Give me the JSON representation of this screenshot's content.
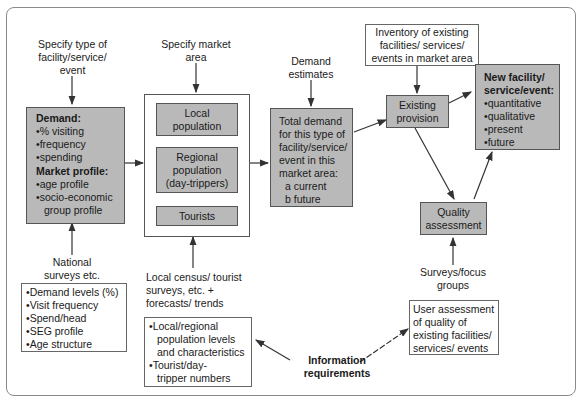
{
  "diagram": {
    "top_labels": {
      "specify_type": "Specify type of\nfacility/service/\nevent",
      "specify_market": "Specify market\narea",
      "demand_estimates": "Demand\nestimates",
      "inventory": "Inventory of existing\nfacilities/ services/\nevents in market area"
    },
    "demand_box": {
      "demand_heading": "Demand:",
      "demand_items": [
        "% visiting",
        "frequency",
        "spending"
      ],
      "profile_heading": "Market profile:",
      "profile_items": [
        "age profile",
        "socio-economic",
        "group profile"
      ]
    },
    "market_area": {
      "local": "Local\npopulation",
      "regional": "Regional\npopulation\n(day-trippers)",
      "tourists": "Tourists"
    },
    "total_demand": {
      "lines": [
        "Total demand",
        "for this type of",
        "facility/service/",
        "event in this",
        "market area:"
      ],
      "a": "a current",
      "b": "b future"
    },
    "existing_provision": "Existing\nprovision",
    "new_facility": {
      "heading": "New facility/\nservice/event:",
      "items": [
        "quantitative",
        "qualitative",
        "present",
        "future"
      ]
    },
    "quality_assessment": "Quality\nassessment",
    "bottom_labels": {
      "national_surveys": "National\nsurveys etc.",
      "local_census": "Local census/ tourist\nsurveys, etc. +\nforecasts/ trends",
      "surveys_focus": "Surveys/focus\ngroups",
      "information_requirements": "Information\nrequirements"
    },
    "national_box": [
      "Demand levels (%)",
      "Visit frequency",
      "Spend/head",
      "SEG profile",
      "Age structure"
    ],
    "local_box": {
      "item1": "Local/regional",
      "item1b": "population levels",
      "item1c": "and characteristics",
      "item2": "Tourist/day-",
      "item2b": "tripper numbers"
    },
    "user_box": "User assessment\nof quality of\nexisting facilities/\nservices/ events"
  },
  "colors": {
    "box_gray": "#b9b9b9",
    "border": "#555555",
    "arrow": "#333333"
  }
}
